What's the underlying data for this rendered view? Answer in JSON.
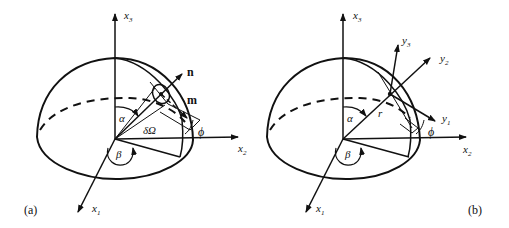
{
  "figure": {
    "panel_a": {
      "tag": "(a)",
      "axes": {
        "x1": "x",
        "x1_sub": "1",
        "x2": "x",
        "x2_sub": "2",
        "x3": "x",
        "x3_sub": "3"
      },
      "vectors": {
        "n": "n",
        "m": "m"
      },
      "angles": {
        "alpha": "α",
        "beta": "β",
        "phi": "ϕ",
        "solid_angle": "δΩ"
      }
    },
    "panel_b": {
      "tag": "(b)",
      "axes": {
        "x1": "x",
        "x1_sub": "1",
        "x2": "x",
        "x2_sub": "2",
        "x3": "x",
        "x3_sub": "3"
      },
      "local_axes": {
        "y1": "y",
        "y1_sub": "1",
        "y2": "y",
        "y2_sub": "2",
        "y3": "y",
        "y3_sub": "3"
      },
      "radius": "r",
      "angles": {
        "alpha": "α",
        "beta": "β",
        "phi": "ϕ"
      }
    },
    "colors": {
      "stroke": "#111111",
      "background": "#ffffff"
    }
  }
}
